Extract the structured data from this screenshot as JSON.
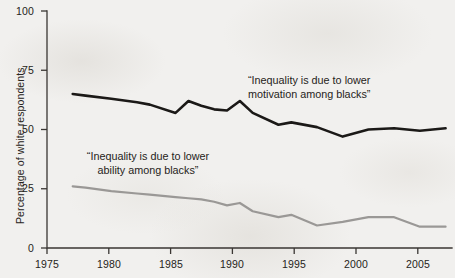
{
  "chart_data": {
    "type": "line",
    "title": "",
    "subtitle": "",
    "xlabel": "",
    "ylabel": "Percentage of white respondents",
    "xlim": [
      1975,
      2006.5
    ],
    "ylim": [
      0,
      100
    ],
    "grid": false,
    "legend_position": "inline-annotations",
    "xticks": [
      "1975",
      "1980",
      "1985",
      "1990",
      "1995",
      "2000",
      "2005"
    ],
    "xtick_values": [
      1975,
      1980,
      1985,
      1990,
      1995,
      2000,
      2005
    ],
    "yticks": [
      "0",
      "25",
      "50",
      "75",
      "100"
    ],
    "ytick_values": [
      0,
      25,
      50,
      75,
      100
    ],
    "series": [
      {
        "name": "“Inequality is due to lower motivation among blacks”",
        "color": "#1b1917",
        "width": 2.6,
        "x": [
          1977,
          1978,
          1980,
          1982,
          1983,
          1985,
          1986,
          1987,
          1988,
          1989,
          1990,
          1991,
          1993,
          1994,
          1996,
          1998,
          2000,
          2002,
          2004,
          2006
        ],
        "values": [
          65,
          64.3,
          63,
          61.5,
          60.5,
          57,
          62,
          60,
          58.5,
          58,
          62,
          57,
          52,
          53,
          51,
          47,
          50,
          50.5,
          49.5,
          50.5
        ]
      },
      {
        "name": "“Inequality is due to lower ability among blacks”",
        "color": "#9a9896",
        "width": 2.2,
        "x": [
          1977,
          1978,
          1980,
          1982,
          1983,
          1985,
          1986,
          1987,
          1988,
          1989,
          1990,
          1991,
          1993,
          1994,
          1996,
          1998,
          2000,
          2002,
          2004,
          2006
        ],
        "values": [
          26,
          25.5,
          24,
          23,
          22.5,
          21.5,
          21,
          20.5,
          19.5,
          18,
          19,
          15.5,
          13,
          14,
          9.5,
          11,
          13,
          13,
          9,
          9
        ]
      }
    ],
    "annotations": [
      {
        "id": "motivation",
        "text_line1": "“Inequality is due to lower",
        "text_line2": "motivation among blacks”",
        "target_series": "motivation"
      },
      {
        "id": "ability",
        "text_line1": "“Inequality is due to lower",
        "text_line2": "ability among blacks”",
        "target_series": "ability"
      }
    ],
    "colors": {
      "background": "#f1f0ee",
      "axis": "#3a3633",
      "text": "#262320",
      "series_motivation": "#1b1917",
      "series_ability": "#9a9896"
    }
  }
}
